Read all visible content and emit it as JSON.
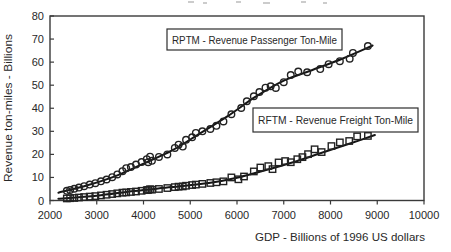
{
  "chart_data": {
    "type": "scatter",
    "title": "",
    "xlabel": "GDP - Billions of 1996 US dollars",
    "ylabel": "Revenue ton-miles - Billions",
    "xlim": [
      2000,
      10000
    ],
    "ylim": [
      0,
      80
    ],
    "xticks": [
      2000,
      3000,
      4000,
      5000,
      6000,
      7000,
      8000,
      9000,
      10000
    ],
    "yticks": [
      0,
      10,
      20,
      30,
      40,
      50,
      60,
      70,
      80
    ],
    "grid": false,
    "legend_position": "inside-plot-boxed",
    "ink_color": "#1f1f1f",
    "series": [
      {
        "name": "RPTM",
        "label": "RPTM - Revenue Passenger Ton-Mile",
        "marker": "circle",
        "fit": "smooth-trend-line",
        "points": [
          [
            2360,
            4.2
          ],
          [
            2430,
            4.6
          ],
          [
            2520,
            5.1
          ],
          [
            2620,
            5.6
          ],
          [
            2730,
            6.2
          ],
          [
            2850,
            6.9
          ],
          [
            2970,
            7.5
          ],
          [
            3090,
            8.3
          ],
          [
            3210,
            9.1
          ],
          [
            3330,
            10.1
          ],
          [
            3440,
            11.3
          ],
          [
            3550,
            12.7
          ],
          [
            3630,
            14.0
          ],
          [
            3730,
            14.5
          ],
          [
            3840,
            15.6
          ],
          [
            3960,
            16.7
          ],
          [
            4070,
            17.9
          ],
          [
            4140,
            19.0
          ],
          [
            4100,
            16.6
          ],
          [
            4180,
            17.2
          ],
          [
            4330,
            18.9
          ],
          [
            4510,
            20.0
          ],
          [
            4670,
            22.8
          ],
          [
            4750,
            24.2
          ],
          [
            4840,
            23.4
          ],
          [
            4910,
            26.3
          ],
          [
            5040,
            27.4
          ],
          [
            5120,
            29.3
          ],
          [
            5260,
            30.0
          ],
          [
            5430,
            31.0
          ],
          [
            5560,
            32.4
          ],
          [
            5710,
            34.3
          ],
          [
            5880,
            37.4
          ],
          [
            6090,
            40.1
          ],
          [
            6210,
            43.0
          ],
          [
            6360,
            45.2
          ],
          [
            6480,
            47.0
          ],
          [
            6610,
            48.9
          ],
          [
            6720,
            49.5
          ],
          [
            6830,
            48.8
          ],
          [
            7000,
            51.3
          ],
          [
            7150,
            54.4
          ],
          [
            7310,
            55.9
          ],
          [
            7500,
            55.6
          ],
          [
            7780,
            57.0
          ],
          [
            7960,
            59.1
          ],
          [
            8200,
            60.4
          ],
          [
            8410,
            61.5
          ],
          [
            8480,
            64.0
          ],
          [
            8800,
            67.0
          ]
        ],
        "trend": [
          [
            2180,
            3.4
          ],
          [
            2800,
            6.6
          ],
          [
            3400,
            10.6
          ],
          [
            4000,
            16.0
          ],
          [
            4600,
            21.6
          ],
          [
            5200,
            29.0
          ],
          [
            5800,
            36.6
          ],
          [
            6400,
            45.0
          ],
          [
            7000,
            52.0
          ],
          [
            7600,
            56.5
          ],
          [
            8250,
            61.5
          ],
          [
            8900,
            67.2
          ]
        ]
      },
      {
        "name": "RFTM",
        "label": "RFTM - Revenue Freight Ton-Mile",
        "marker": "square",
        "fit": "smooth-trend-line",
        "points": [
          [
            2360,
            0.9
          ],
          [
            2430,
            1.0
          ],
          [
            2520,
            1.1
          ],
          [
            2620,
            1.3
          ],
          [
            2730,
            1.5
          ],
          [
            2850,
            1.7
          ],
          [
            2970,
            1.9
          ],
          [
            3090,
            2.2
          ],
          [
            3210,
            2.5
          ],
          [
            3330,
            2.8
          ],
          [
            3440,
            3.1
          ],
          [
            3550,
            3.4
          ],
          [
            3630,
            3.5
          ],
          [
            3730,
            3.7
          ],
          [
            3840,
            3.9
          ],
          [
            3960,
            4.2
          ],
          [
            4070,
            4.5
          ],
          [
            4140,
            4.9
          ],
          [
            4100,
            4.6
          ],
          [
            4180,
            4.7
          ],
          [
            4330,
            5.0
          ],
          [
            4510,
            5.4
          ],
          [
            4670,
            5.8
          ],
          [
            4750,
            6.0
          ],
          [
            4840,
            6.1
          ],
          [
            4910,
            6.4
          ],
          [
            5040,
            6.7
          ],
          [
            5120,
            6.9
          ],
          [
            5260,
            7.2
          ],
          [
            5430,
            7.6
          ],
          [
            5560,
            7.9
          ],
          [
            5710,
            8.3
          ],
          [
            5880,
            10.0
          ],
          [
            6030,
            9.2
          ],
          [
            6150,
            10.4
          ],
          [
            6360,
            12.6
          ],
          [
            6500,
            14.3
          ],
          [
            6670,
            14.9
          ],
          [
            6760,
            13.6
          ],
          [
            6890,
            16.5
          ],
          [
            7030,
            17.1
          ],
          [
            7150,
            16.6
          ],
          [
            7290,
            17.9
          ],
          [
            7400,
            18.8
          ],
          [
            7520,
            20.1
          ],
          [
            7660,
            22.2
          ],
          [
            7810,
            21.0
          ],
          [
            8020,
            23.6
          ],
          [
            8200,
            25.2
          ],
          [
            8400,
            25.8
          ],
          [
            8570,
            27.8
          ],
          [
            8800,
            28.0
          ]
        ],
        "trend": [
          [
            2180,
            0.8
          ],
          [
            3000,
            2.1
          ],
          [
            3800,
            4.1
          ],
          [
            4600,
            5.8
          ],
          [
            5400,
            7.6
          ],
          [
            6000,
            9.9
          ],
          [
            6600,
            13.1
          ],
          [
            7200,
            16.6
          ],
          [
            7800,
            20.6
          ],
          [
            8400,
            24.6
          ],
          [
            8950,
            28.4
          ]
        ]
      }
    ]
  }
}
